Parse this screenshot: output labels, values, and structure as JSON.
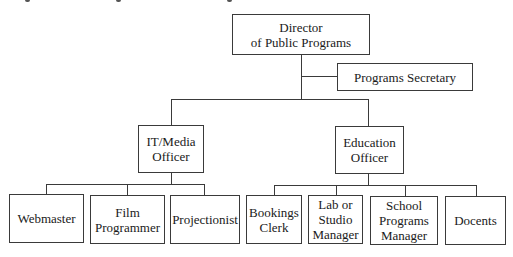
{
  "diagram": {
    "type": "org-chart",
    "line_color": "#3a3a3a",
    "nodes": {
      "director": {
        "label": "Director\nof Public Programs"
      },
      "secretary": {
        "label": "Programs Secretary"
      },
      "it_media": {
        "label": "IT/Media\nOfficer"
      },
      "education": {
        "label": "Education\nOfficer"
      },
      "webmaster": {
        "label": "Webmaster"
      },
      "film_programmer": {
        "label": "Film\nProgrammer"
      },
      "projectionist": {
        "label": "Projectionist"
      },
      "bookings_clerk": {
        "label": "Bookings\nClerk"
      },
      "lab_studio_manager": {
        "label": "Lab or\nStudio\nManager"
      },
      "school_programs_manager": {
        "label": "School\nPrograms\nManager"
      },
      "docents": {
        "label": "Docents"
      }
    },
    "edges": [
      [
        "director",
        "secretary"
      ],
      [
        "director",
        "it_media"
      ],
      [
        "director",
        "education"
      ],
      [
        "it_media",
        "webmaster"
      ],
      [
        "it_media",
        "film_programmer"
      ],
      [
        "it_media",
        "projectionist"
      ],
      [
        "education",
        "bookings_clerk"
      ],
      [
        "education",
        "lab_studio_manager"
      ],
      [
        "education",
        "school_programs_manager"
      ],
      [
        "education",
        "docents"
      ]
    ]
  }
}
